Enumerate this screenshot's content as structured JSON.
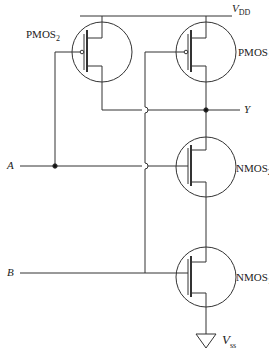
{
  "diagram": {
    "supply": {
      "vdd_label": "V",
      "vdd_sub": "DD",
      "vss_label": "V",
      "vss_sub": "ss"
    },
    "transistors": [
      {
        "id": "pmos2",
        "label": "PMOS",
        "sub": "2"
      },
      {
        "id": "pmos1",
        "label": "PMOS",
        "sub": "1"
      },
      {
        "id": "nmos2",
        "label": "NMOS",
        "sub": "2"
      },
      {
        "id": "nmos1",
        "label": "NMOS",
        "sub": "1"
      }
    ],
    "inputs": {
      "a": "A",
      "b": "B"
    },
    "output": {
      "y": "Y"
    }
  }
}
